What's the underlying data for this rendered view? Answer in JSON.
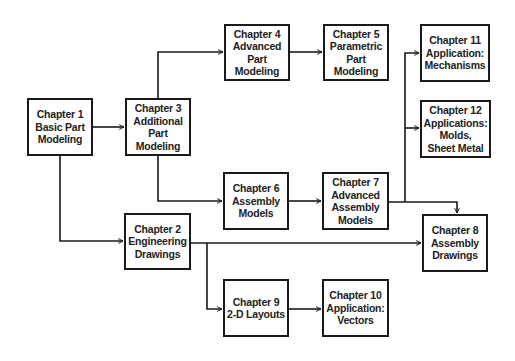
{
  "colors": {
    "line": "#1a1a1a",
    "text": "#222222",
    "background": "#ffffff"
  },
  "nodes": {
    "ch1": {
      "lines": [
        "Chapter 1",
        "Basic Part",
        "Modeling"
      ]
    },
    "ch2": {
      "lines": [
        "Chapter 2",
        "Engineering",
        "Drawings"
      ]
    },
    "ch3": {
      "lines": [
        "Chapter 3",
        "Additional",
        "Part",
        "Modeling"
      ]
    },
    "ch4": {
      "lines": [
        "Chapter 4",
        "Advanced",
        "Part",
        "Modeling"
      ]
    },
    "ch5": {
      "lines": [
        "Chapter 5",
        "Parametric",
        "Part",
        "Modeling"
      ]
    },
    "ch6": {
      "lines": [
        "Chapter 6",
        "Assembly",
        "Models"
      ]
    },
    "ch7": {
      "lines": [
        "Chapter 7",
        "Advanced",
        "Assembly",
        "Models"
      ]
    },
    "ch8": {
      "lines": [
        "Chapter 8",
        "Assembly",
        "Drawings"
      ]
    },
    "ch9": {
      "lines": [
        "Chapter 9",
        "2-D Layouts"
      ]
    },
    "ch10": {
      "lines": [
        "Chapter 10",
        "Application:",
        "Vectors"
      ]
    },
    "ch11": {
      "lines": [
        "Chapter 11",
        "Application:",
        "Mechanisms"
      ]
    },
    "ch12": {
      "lines": [
        "Chapter 12",
        "Applications:",
        "Molds,",
        "Sheet Metal"
      ]
    }
  },
  "edges": [
    {
      "from": "ch1",
      "to": "ch3"
    },
    {
      "from": "ch1",
      "to": "ch2"
    },
    {
      "from": "ch3",
      "to": "ch4"
    },
    {
      "from": "ch3",
      "to": "ch6"
    },
    {
      "from": "ch4",
      "to": "ch5"
    },
    {
      "from": "ch6",
      "to": "ch7"
    },
    {
      "from": "ch7",
      "to": "ch11"
    },
    {
      "from": "ch7",
      "to": "ch12"
    },
    {
      "from": "ch7",
      "to": "ch8"
    },
    {
      "from": "ch2",
      "to": "ch8"
    },
    {
      "from": "ch2",
      "to": "ch9"
    },
    {
      "from": "ch9",
      "to": "ch10"
    }
  ]
}
